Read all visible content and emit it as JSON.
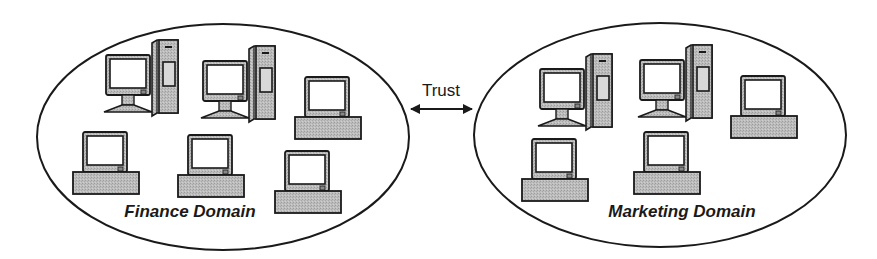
{
  "diagram": {
    "type": "trust-relationship",
    "colors": {
      "outline": "#1a1a1a",
      "device_fill": "#b8b8b8",
      "screen_fill": "#ffffff",
      "background": "#ffffff"
    },
    "domains": [
      {
        "id": "finance",
        "label": "Finance Domain",
        "ellipse": {
          "cx": 223,
          "cy": 137,
          "rx": 186,
          "ry": 113
        },
        "label_pos": {
          "x": 188,
          "y": 221
        },
        "computers": [
          {
            "type": "tower",
            "x": 105,
            "y": 40
          },
          {
            "type": "tower",
            "x": 202,
            "y": 46
          },
          {
            "type": "desktop",
            "x": 295,
            "y": 77
          },
          {
            "type": "desktop",
            "x": 73,
            "y": 132
          },
          {
            "type": "desktop",
            "x": 178,
            "y": 135
          },
          {
            "type": "desktop",
            "x": 275,
            "y": 151
          }
        ]
      },
      {
        "id": "marketing",
        "label": "Marketing Domain",
        "ellipse": {
          "cx": 660,
          "cy": 135,
          "rx": 186,
          "ry": 112
        },
        "label_pos": {
          "x": 682,
          "y": 221
        },
        "computers": [
          {
            "type": "tower",
            "x": 539,
            "y": 54
          },
          {
            "type": "tower",
            "x": 639,
            "y": 45
          },
          {
            "type": "desktop",
            "x": 731,
            "y": 76
          },
          {
            "type": "desktop",
            "x": 522,
            "y": 139
          },
          {
            "type": "desktop",
            "x": 634,
            "y": 132
          }
        ]
      }
    ],
    "relationship": {
      "label": "Trust",
      "direction": "bidirectional",
      "from": "finance",
      "to": "marketing",
      "arrow": {
        "x1": 410,
        "x2": 473,
        "y": 109
      },
      "label_pos": {
        "x": 441,
        "y": 99
      }
    }
  }
}
